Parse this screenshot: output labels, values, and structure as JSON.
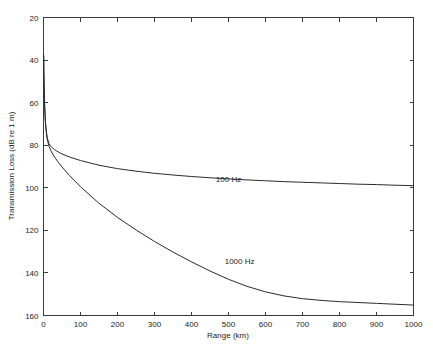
{
  "chart_data": {
    "type": "line",
    "title": "",
    "xlabel": "Range (km)",
    "ylabel": "Transmission Loss (dB re 1 m)",
    "xlim": [
      0,
      1000
    ],
    "ylim": [
      20,
      160
    ],
    "y_inverted": true,
    "grid": false,
    "legend_position": "inline-annotations",
    "xticks": [
      0,
      100,
      200,
      300,
      400,
      500,
      600,
      700,
      800,
      900,
      1000
    ],
    "xticklabels": [
      "0",
      "100",
      "200",
      "300",
      "400",
      "500",
      "600",
      "700",
      "800",
      "900",
      "1000"
    ],
    "yticks": [
      20,
      40,
      60,
      80,
      100,
      120,
      140,
      160
    ],
    "yticklabels": [
      "20",
      "40",
      "60",
      "80",
      "100",
      "120",
      "140",
      "160"
    ],
    "series": [
      {
        "name": "100 Hz",
        "label": "100 Hz",
        "annotation": "100 Hz",
        "color": "#2b2b2b",
        "x": [
          0.5,
          1,
          2,
          3,
          5,
          7,
          10,
          15,
          20,
          30,
          40,
          50,
          70,
          100,
          150,
          200,
          250,
          300,
          350,
          400,
          450,
          500,
          550,
          600,
          650,
          700,
          750,
          800,
          850,
          900,
          950,
          1000
        ],
        "y": [
          38.0,
          46.0,
          55.0,
          61.0,
          68.5,
          72.5,
          76.5,
          79.3,
          80.6,
          82.1,
          83.2,
          84.1,
          85.5,
          87.2,
          89.4,
          91.0,
          92.2,
          93.2,
          94.0,
          94.7,
          95.3,
          95.8,
          96.3,
          96.7,
          97.1,
          97.4,
          97.7,
          98.0,
          98.3,
          98.5,
          98.8,
          99.0
        ]
      },
      {
        "name": "1000 Hz",
        "label": "1000 Hz",
        "annotation": "1000 Hz",
        "color": "#2b2b2b",
        "x": [
          0.5,
          1,
          2,
          3,
          5,
          7,
          10,
          15,
          20,
          30,
          40,
          50,
          70,
          100,
          150,
          200,
          250,
          300,
          350,
          400,
          450,
          500,
          550,
          600,
          650,
          700,
          750,
          800,
          850,
          900,
          950,
          1000
        ],
        "y": [
          38.0,
          46.0,
          55.0,
          61.2,
          68.8,
          73.0,
          77.2,
          80.6,
          82.6,
          85.6,
          88.0,
          90.2,
          94.2,
          99.5,
          107.3,
          113.9,
          119.8,
          125.2,
          130.2,
          134.8,
          139.1,
          143.0,
          146.3,
          148.9,
          150.8,
          152.1,
          152.9,
          153.5,
          153.9,
          154.3,
          154.7,
          155.1
        ]
      }
    ],
    "annotations": [
      {
        "text": "100 Hz",
        "x": 500,
        "y": 97.5
      },
      {
        "text": "1000 Hz",
        "x": 530,
        "y": 136.0
      }
    ]
  },
  "figure": {
    "background_color": "#ffffff",
    "axis_color": "#3a3a3a",
    "curve_color": "#2b2b2b"
  }
}
